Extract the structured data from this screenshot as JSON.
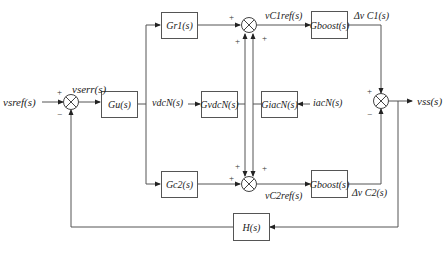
{
  "diagram": {
    "type": "control-block-diagram",
    "blocks": {
      "gu": "Gu(s)",
      "gr1": "Gr1(s)",
      "gc2": "Gc2(s)",
      "gvdcn": "GvdcN(s)",
      "giacn": "GiacN(s)",
      "gboost1": "Gboost(s)",
      "gboost2": "Gboost(s)",
      "h": "H(s)"
    },
    "signals": {
      "input": "vsref(s)",
      "error": "vserr(s)",
      "vdcn": "vdcN(s)",
      "iacn": "iacN(s)",
      "vc1ref": "vC1ref(s)",
      "vc2ref": "vC2ref(s)",
      "dvc1": "Δv C1(s)",
      "dvc2": "Δv C2(s)",
      "output": "vss(s)"
    },
    "signs": {
      "left_sum_plus": "+",
      "left_sum_minus": "−",
      "top_sum_left": "+",
      "top_sum_bl": "+",
      "top_sum_br": "+",
      "bot_sum_left": "+",
      "bot_sum_tl": "+",
      "bot_sum_tr": "+",
      "right_sum_plus": "+",
      "right_sum_minus": "−"
    },
    "line_color": "#555555"
  }
}
